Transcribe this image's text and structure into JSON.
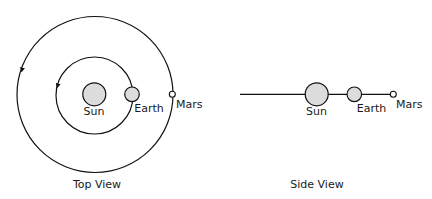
{
  "diagram": {
    "colors": {
      "stroke": "#111111",
      "body_fill": "#dcdcdc",
      "mars_fill": "#ffffff",
      "background": "#ffffff"
    },
    "top_view": {
      "title": "Top View",
      "orbits": [
        {
          "name": "Earth orbit",
          "radius": 38.5,
          "direction": "counterclockwise"
        },
        {
          "name": "Mars orbit",
          "radius": 78,
          "direction": "counterclockwise"
        }
      ],
      "bodies": [
        {
          "name": "Sun",
          "label": "Sun"
        },
        {
          "name": "Earth",
          "label": "Earth"
        },
        {
          "name": "Mars",
          "label": "Mars"
        }
      ]
    },
    "side_view": {
      "title": "Side View",
      "bodies": [
        {
          "name": "Sun",
          "label": "Sun"
        },
        {
          "name": "Earth",
          "label": "Earth"
        },
        {
          "name": "Mars",
          "label": "Mars"
        }
      ]
    }
  }
}
